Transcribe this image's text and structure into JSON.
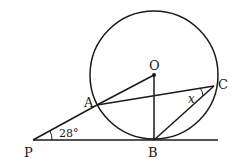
{
  "diagram": {
    "points": {
      "O": {
        "label": "O",
        "x": 154,
        "y": 75
      },
      "A": {
        "label": "A",
        "x": 97,
        "y": 105
      },
      "B": {
        "label": "B",
        "x": 154,
        "y": 140
      },
      "C": {
        "label": "C",
        "x": 214,
        "y": 86
      },
      "P": {
        "label": "P",
        "x": 33,
        "y": 140
      }
    },
    "circle": {
      "center": "O",
      "radius": 64
    },
    "angles": {
      "P": {
        "label": "28°"
      },
      "C": {
        "label": "x"
      }
    },
    "colors": {
      "stroke": "#1a1a1a",
      "background": "#ffffff"
    }
  }
}
